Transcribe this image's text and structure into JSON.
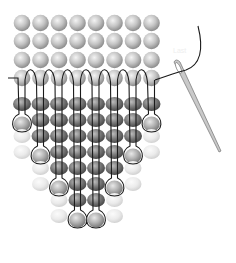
{
  "diagram": {
    "annotation_label": "Last",
    "colors": {
      "background": "#ffffff",
      "bead_light": "#d8d8d8",
      "bead_mid": "#9a9a9a",
      "bead_dark": "#6a6a6a",
      "bead_faded": "#ececec",
      "thread": "#1a1a1a",
      "needle": "#b0b0b0"
    },
    "grid": {
      "columns": 8,
      "column_x": [
        22,
        40.5,
        59,
        77.5,
        96,
        114.5,
        133,
        151.5
      ],
      "top_rows_y": [
        23,
        41,
        60,
        78
      ],
      "body_rows_y": [
        104,
        120,
        136,
        152,
        168,
        184,
        200,
        216,
        232
      ]
    },
    "fringe_lengths": [
      2,
      4,
      6,
      8,
      8,
      6,
      4,
      2
    ],
    "needle": {
      "eye_x": 178,
      "eye_y": 66,
      "tip_x": 219,
      "tip_y": 150
    }
  }
}
